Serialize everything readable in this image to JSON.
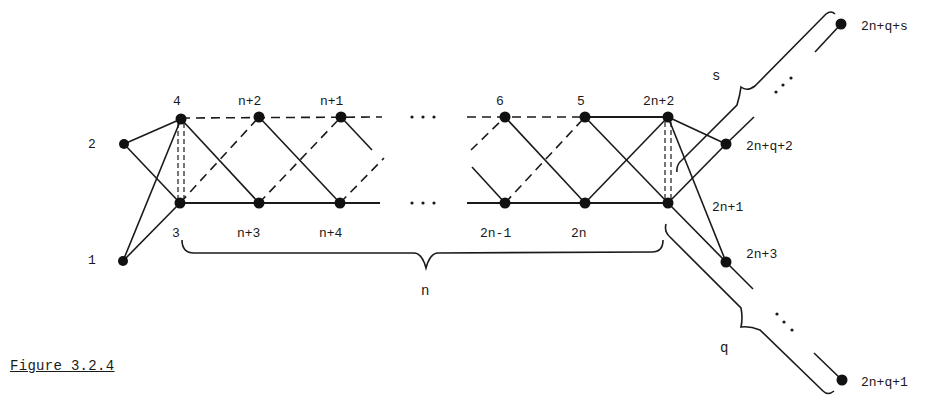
{
  "figure": {
    "caption": "Figure 3.2.4",
    "colors": {
      "ink": "#1a1a1a",
      "background": "#ffffff"
    }
  },
  "nodes": [
    {
      "id": "1",
      "label": "1",
      "x": 123,
      "y": 261,
      "lx": 88,
      "ly": 259
    },
    {
      "id": "2",
      "label": "2",
      "x": 124,
      "y": 144,
      "lx": 88,
      "ly": 143
    },
    {
      "id": "3",
      "label": "3",
      "x": 180,
      "y": 203,
      "lx": 172,
      "ly": 232
    },
    {
      "id": "4",
      "label": "4",
      "x": 181,
      "y": 119,
      "lx": 172,
      "ly": 100
    },
    {
      "id": "n+2",
      "label": "n+2",
      "x": 259,
      "y": 117,
      "lx": 238,
      "ly": 100
    },
    {
      "id": "n+1",
      "label": "n+1",
      "x": 341,
      "y": 117,
      "lx": 320,
      "ly": 100
    },
    {
      "id": "n+3",
      "label": "n+3",
      "x": 259,
      "y": 203,
      "lx": 238,
      "ly": 232
    },
    {
      "id": "n+4",
      "label": "n+4",
      "x": 340,
      "y": 203,
      "lx": 319,
      "ly": 232
    },
    {
      "id": "6",
      "label": "6",
      "x": 505,
      "y": 117,
      "lx": 496,
      "ly": 100
    },
    {
      "id": "5",
      "label": "5",
      "x": 585,
      "y": 117,
      "lx": 576,
      "ly": 100
    },
    {
      "id": "2n+2",
      "label": "2n+2",
      "x": 668,
      "y": 117,
      "lx": 642,
      "ly": 100
    },
    {
      "id": "2n-1",
      "label": "2n-1",
      "x": 505,
      "y": 203,
      "lx": 480,
      "ly": 232
    },
    {
      "id": "2n",
      "label": "2n",
      "x": 585,
      "y": 203,
      "lx": 572,
      "ly": 232
    },
    {
      "id": "2n+1",
      "label": "2n+1",
      "x": 668,
      "y": 203,
      "lx": 713,
      "ly": 207
    },
    {
      "id": "2n+q+2",
      "label": "2n+q+2",
      "x": 726,
      "y": 144,
      "lx": 746,
      "ly": 149
    },
    {
      "id": "2n+3",
      "label": "2n+3",
      "x": 726,
      "y": 262,
      "lx": 746,
      "ly": 257
    },
    {
      "id": "2n+q+s",
      "label": "2n+q+s",
      "x": 841,
      "y": 24,
      "lx": 861,
      "ly": 29
    },
    {
      "id": "2n+q+1",
      "label": "2n+q+1",
      "x": 842,
      "y": 380,
      "lx": 861,
      "ly": 385
    }
  ],
  "braces": {
    "n": {
      "label": "n",
      "lx": 421,
      "ly": 294
    },
    "s": {
      "label": "s",
      "lx": 712,
      "ly": 79
    },
    "q": {
      "label": "q",
      "lx": 720,
      "ly": 352
    }
  },
  "ellipses": {
    "top": "· · ·",
    "bottom": "· · ·"
  }
}
